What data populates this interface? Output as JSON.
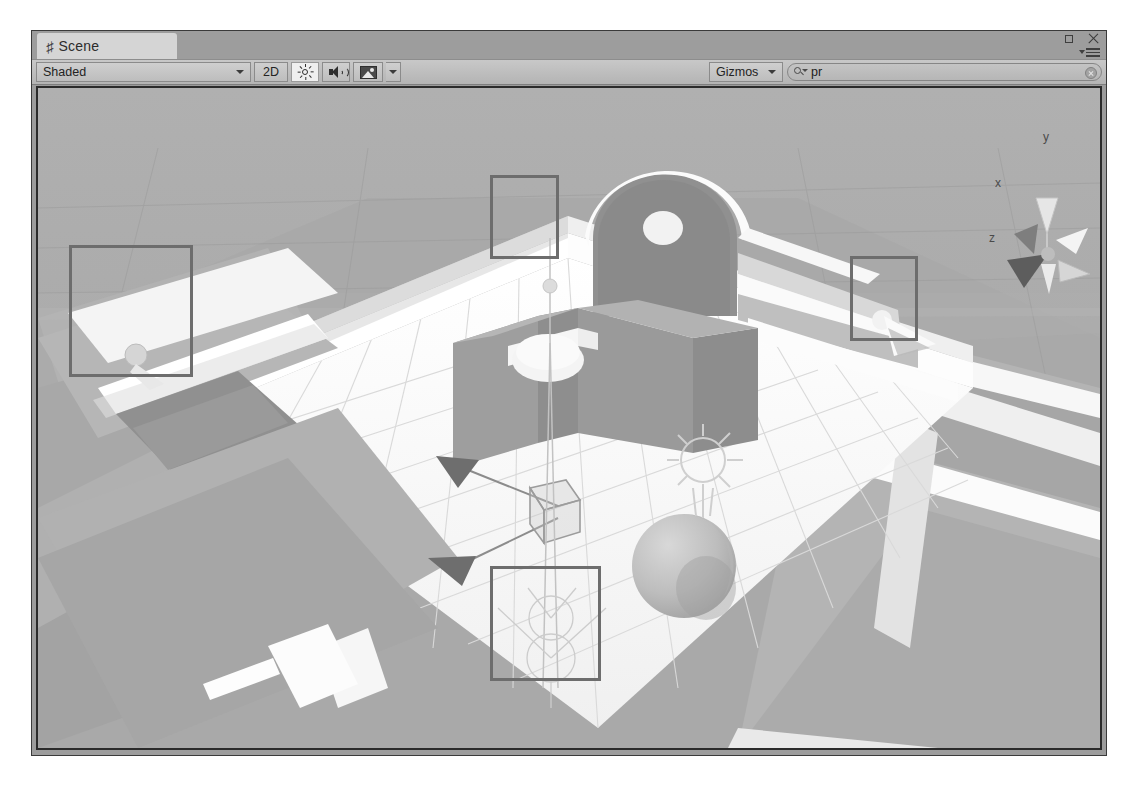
{
  "window": {
    "tab": {
      "icon": "hash-icon",
      "label": "Scene"
    },
    "controls": {
      "maximize": "maximize-icon",
      "close": "close-icon",
      "options": "panel-options-icon"
    }
  },
  "toolbar": {
    "shading_mode": "Shaded",
    "view_mode_2d": "2D",
    "lighting_icon": "sun-icon",
    "audio_icon": "speaker-icon",
    "effects_icon": "image-icon",
    "effects_caret": "chevron-down-icon",
    "gizmos_label": "Gizmos",
    "gizmos_caret": "chevron-down-icon",
    "search": {
      "value": "pr",
      "placeholder": "",
      "icon": "search-icon",
      "clear": "clear-icon"
    }
  },
  "scene": {
    "axis_gizmo": {
      "x": "x",
      "y": "y",
      "z": "z"
    },
    "selection_boxes": [
      {
        "name": "selection-box-top",
        "x": 452,
        "y": 87,
        "w": 69,
        "h": 84
      },
      {
        "name": "selection-box-left",
        "x": 31,
        "y": 157,
        "w": 124,
        "h": 132
      },
      {
        "name": "selection-box-right",
        "x": 812,
        "y": 168,
        "w": 68,
        "h": 85
      },
      {
        "name": "selection-box-bottom",
        "x": 452,
        "y": 478,
        "w": 111,
        "h": 115
      }
    ],
    "colors": {
      "background": "#a8a8a8",
      "floor": "#f2f2f2",
      "wall_light": "#ffffff",
      "wall_mid": "#b9b9b9",
      "wall_dark": "#8f8f8f",
      "gizmo_outline": "#6d6d6d",
      "viewport_border": "#2b2b2b"
    }
  }
}
